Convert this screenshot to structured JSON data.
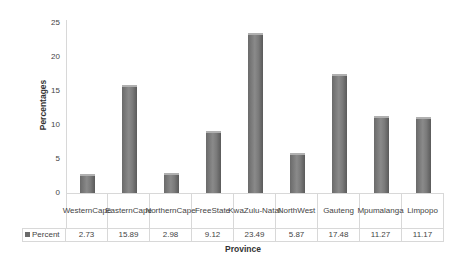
{
  "chart_data": {
    "type": "bar",
    "title": "",
    "xlabel": "Province",
    "ylabel": "Percentages",
    "ylim": [
      0,
      25
    ],
    "yticks": [
      0,
      5,
      10,
      15,
      20,
      25
    ],
    "grid": false,
    "legend_position": "data-table",
    "data_table": true,
    "categories": [
      "Western Cape",
      "Eastern Cape",
      "Northern Cape",
      "Free State",
      "KwaZulu-Natal",
      "North West",
      "Gauteng",
      "Mpumalanga",
      "Limpopo"
    ],
    "category_display": [
      [
        "Western",
        "Cape"
      ],
      [
        "Eastern",
        "Cape"
      ],
      [
        "Northern",
        "Cape"
      ],
      [
        "Free",
        "State"
      ],
      [
        "KwaZulu-",
        "Natal"
      ],
      [
        "North",
        "West"
      ],
      [
        "Gauteng",
        ""
      ],
      [
        "Mpumala",
        "nga"
      ],
      [
        "Limpopo",
        ""
      ]
    ],
    "series": [
      {
        "name": "Percent",
        "color": "#6a6a6a",
        "values": [
          2.73,
          15.89,
          2.98,
          9.12,
          23.49,
          5.87,
          17.48,
          11.27,
          11.17
        ],
        "value_labels": [
          "2.73",
          "15.89",
          "2.98",
          "9.12",
          "23.49",
          "5.87",
          "17.48",
          "11.27",
          "11.17"
        ]
      }
    ]
  },
  "axis": {
    "y_ticks": [
      "25",
      "20",
      "15",
      "10",
      "5",
      "0"
    ],
    "y_label": "Percentages",
    "x_label": "Province"
  },
  "legend": {
    "label": "Percent"
  }
}
